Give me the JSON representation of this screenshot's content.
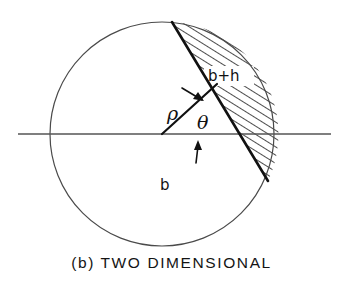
{
  "figure": {
    "caption": "(b) TWO DIMENSIONAL",
    "caption_prefix": "(b)",
    "caption_title": "TWO DIMENSIONAL",
    "labels": {
      "hatched_region": "b+h",
      "base_region": "b",
      "radius": "ρ",
      "angle": "θ"
    },
    "colors": {
      "stroke": "#1a1a1a",
      "outline": "#444444",
      "background": "#ffffff",
      "hatch": "#111111"
    },
    "geometry": {
      "circle_center_x": 162,
      "circle_center_y": 134,
      "circle_radius": 112,
      "chord_start_x": 172,
      "chord_start_y": 22,
      "chord_end_x": 268,
      "chord_end_y": 181,
      "axis_start_x": 18,
      "axis_end_x": 331,
      "axis_y": 134,
      "radius_end_x": 217,
      "radius_end_y": 84,
      "hatch_angle_deg": 60
    }
  }
}
